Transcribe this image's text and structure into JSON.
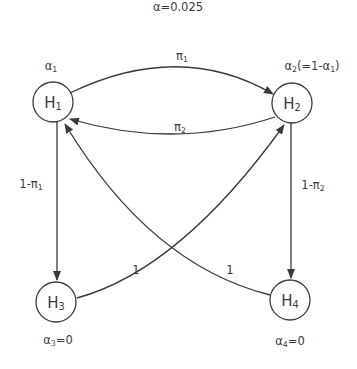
{
  "title": "α=0.025",
  "nodes": {
    "h1": {
      "name": "H",
      "sub": "1",
      "weight_main": "α",
      "weight_sub": "1",
      "weight_suffix": ""
    },
    "h2": {
      "name": "H",
      "sub": "2",
      "weight_main": "α",
      "weight_sub": "2",
      "weight_suffix_pre": "(=1-α",
      "weight_suffix_sub": "1",
      "weight_suffix_post": ")"
    },
    "h3": {
      "name": "H",
      "sub": "3",
      "weight_main": "α",
      "weight_sub": "3",
      "weight_suffix": "=0"
    },
    "h4": {
      "name": "H",
      "sub": "4",
      "weight_main": "α",
      "weight_sub": "4",
      "weight_suffix": "=0"
    }
  },
  "edges": {
    "h1_to_h2": {
      "main": "π",
      "sub": "1"
    },
    "h2_to_h1": {
      "main": "π",
      "sub": "2"
    },
    "h1_to_h3": {
      "main": "1-π",
      "sub": "1"
    },
    "h2_to_h4": {
      "main": "1-π",
      "sub": "2"
    },
    "h3_to_h2": {
      "main": "1"
    },
    "h4_to_h1": {
      "main": "1"
    }
  },
  "colors": {
    "stroke": "#3a3a3a",
    "background": "#ffffff"
  }
}
